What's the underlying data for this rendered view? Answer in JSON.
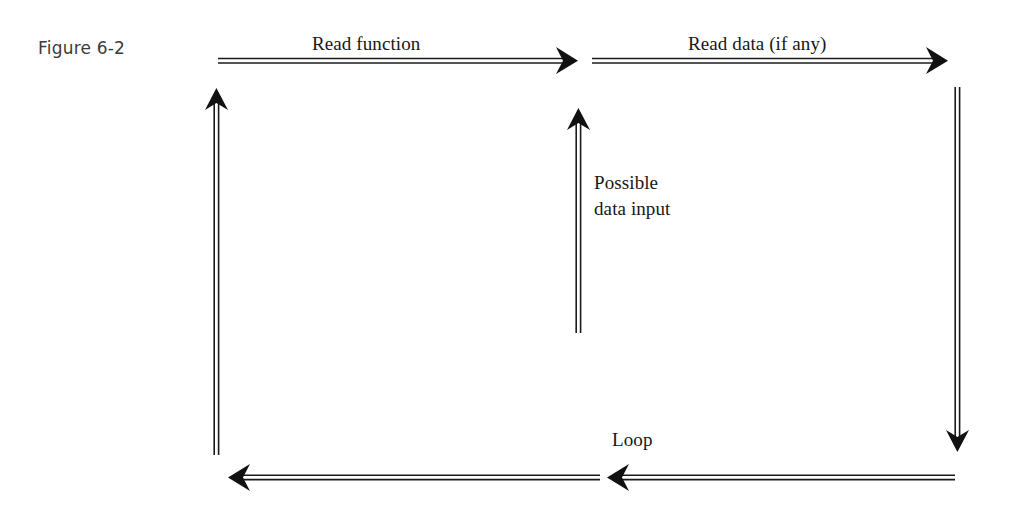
{
  "figure": {
    "caption": "Figure 6-2"
  },
  "diagram": {
    "type": "flow-loop-diagram",
    "background_color": "#ffffff",
    "line_color": "#1a1a1a",
    "labels": {
      "read_function": "Read function",
      "read_data": "Read data (if any)",
      "possible_data_input_line1": "Possible",
      "possible_data_input_line2": "data input",
      "loop": "Loop"
    },
    "arrows": [
      {
        "name": "read-function-arrow",
        "label": "Read function",
        "direction": "right",
        "from": [
          218,
          60
        ],
        "to": [
          578,
          60
        ]
      },
      {
        "name": "read-data-arrow",
        "label": "Read data (if any)",
        "direction": "right",
        "from": [
          592,
          60
        ],
        "to": [
          948,
          60
        ]
      },
      {
        "name": "possible-data-input-arrow",
        "label": "Possible data input",
        "direction": "up",
        "from": [
          578,
          333
        ],
        "to": [
          578,
          108
        ]
      },
      {
        "name": "left-return-arrow",
        "label": "",
        "direction": "up",
        "from": [
          216,
          455
        ],
        "to": [
          216,
          88
        ]
      },
      {
        "name": "right-descend-arrow",
        "label": "",
        "direction": "down",
        "from": [
          957,
          87
        ],
        "to": [
          957,
          452
        ]
      },
      {
        "name": "loop-arrow-left-segment",
        "label": "Loop",
        "direction": "left",
        "from": [
          600,
          477
        ],
        "to": [
          228,
          477
        ]
      },
      {
        "name": "loop-arrow-right-segment",
        "label": "",
        "direction": "left",
        "from": [
          955,
          477
        ],
        "to": [
          607,
          477
        ]
      }
    ]
  }
}
